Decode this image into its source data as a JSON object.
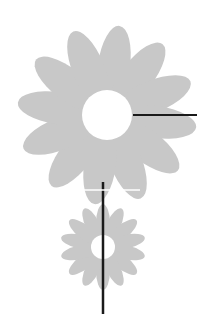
{
  "canvas": {
    "width": 197,
    "height": 314,
    "background": "#ffffff"
  },
  "colors": {
    "petal": "#c8c8c8",
    "center": "#ffffff",
    "line": "#1a1a1a"
  },
  "flowers": [
    {
      "name": "large-flower",
      "cx": 107,
      "cy": 115,
      "petals": 12,
      "petal_len": 80,
      "petal_w": 16,
      "center_r": 25
    },
    {
      "name": "small-flower",
      "cx": 103,
      "cy": 247,
      "petals": 14,
      "petal_len": 38,
      "petal_w": 7,
      "center_r": 12
    }
  ],
  "lines": {
    "horizontal": {
      "x1": 133,
      "y1": 115,
      "x2": 197,
      "y2": 115
    },
    "stem": {
      "x1": 103,
      "y1": 182,
      "x2": 103,
      "y2": 314
    },
    "white_band": {
      "x1": 84,
      "y1": 190,
      "x2": 140,
      "y2": 190
    }
  }
}
